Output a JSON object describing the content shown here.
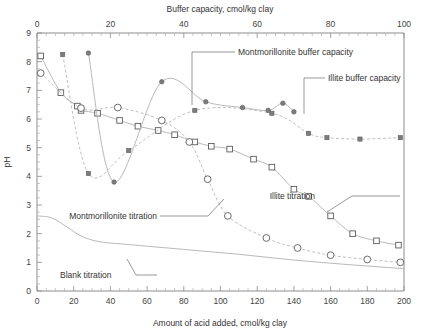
{
  "chart_data": {
    "type": "line",
    "title": "",
    "xlabel": "Amount of acid added, cmol/kg clay",
    "xlabel_top": "Buffer capacity, cmol/kg clay",
    "ylabel": "pH",
    "xlim": [
      0,
      200
    ],
    "xlim_top": [
      0,
      100
    ],
    "ylim": [
      0,
      9
    ],
    "grid": false,
    "legend_position": "none",
    "x_ticks": [
      0,
      20,
      40,
      60,
      80,
      100,
      120,
      140,
      160,
      180,
      200
    ],
    "x_ticks_top": [
      0,
      20,
      40,
      60,
      80,
      100
    ],
    "y_ticks": [
      0,
      1,
      2,
      3,
      4,
      5,
      6,
      7,
      8,
      9
    ],
    "x_minor_step": 5,
    "x_minor_step_top": 2.5,
    "y_minor_step": 0.25,
    "series": [
      {
        "name": "Illite titration",
        "marker": "open-square",
        "axis": "bottom",
        "points": [
          [
            2,
            8.2
          ],
          [
            13,
            6.92
          ],
          [
            22,
            6.45
          ],
          [
            24,
            6.3
          ],
          [
            33,
            6.2
          ],
          [
            45,
            5.95
          ],
          [
            55,
            5.75
          ],
          [
            66,
            5.6
          ],
          [
            75,
            5.45
          ],
          [
            86,
            5.2
          ],
          [
            95,
            5.05
          ],
          [
            105,
            4.95
          ],
          [
            118,
            4.6
          ],
          [
            128,
            4.32
          ],
          [
            140,
            3.55
          ],
          [
            148,
            3.3
          ],
          [
            160,
            2.62
          ],
          [
            172,
            2.0
          ],
          [
            185,
            1.75
          ],
          [
            197,
            1.6
          ]
        ]
      },
      {
        "name": "Montmorillonite titration",
        "marker": "open-circle",
        "axis": "bottom",
        "points": [
          [
            2,
            7.6
          ],
          [
            24,
            6.38
          ],
          [
            44,
            6.4
          ],
          [
            68,
            5.95
          ],
          [
            83,
            5.2
          ],
          [
            93,
            3.9
          ],
          [
            104,
            2.62
          ],
          [
            125,
            1.85
          ],
          [
            142,
            1.5
          ],
          [
            160,
            1.25
          ],
          [
            180,
            1.1
          ],
          [
            198,
            1.0
          ]
        ]
      },
      {
        "name": "Illite buffer capacity",
        "marker": "filled-square",
        "axis": "top",
        "points": [
          [
            7,
            8.25
          ],
          [
            14,
            4.1
          ],
          [
            25,
            4.9
          ],
          [
            43,
            6.3
          ],
          [
            64,
            6.2
          ],
          [
            74,
            5.5
          ],
          [
            79,
            5.35
          ],
          [
            88,
            5.3
          ],
          [
            99,
            5.35
          ]
        ]
      },
      {
        "name": "Montmorillonite buffer capacity",
        "marker": "filled-circle",
        "axis": "top",
        "points": [
          [
            14,
            8.3
          ],
          [
            21,
            3.8
          ],
          [
            34,
            7.3
          ],
          [
            46,
            6.6
          ],
          [
            56,
            6.4
          ],
          [
            63,
            6.3
          ],
          [
            67,
            6.55
          ],
          [
            70,
            6.25
          ]
        ]
      },
      {
        "name": "Blank titration",
        "marker": "none",
        "axis": "bottom",
        "points": [
          [
            0,
            2.62
          ],
          [
            8,
            2.55
          ],
          [
            16,
            2.25
          ],
          [
            24,
            1.92
          ],
          [
            34,
            1.72
          ],
          [
            50,
            1.62
          ],
          [
            80,
            1.45
          ],
          [
            110,
            1.28
          ],
          [
            140,
            1.08
          ],
          [
            170,
            0.92
          ],
          [
            200,
            0.78
          ]
        ]
      }
    ],
    "annotations": [
      {
        "text": "Montmorillonite buffer capacity",
        "target_note": "points to montmorillonite buffer capacity curve"
      },
      {
        "text": "Illite buffer capacity",
        "target_note": "points to illite buffer capacity curve"
      },
      {
        "text": "Illite titration",
        "target_note": "points to illite titration curve"
      },
      {
        "text": "Montmorillonite titration",
        "target_note": "points to montmorillonite titration curve"
      },
      {
        "text": "Blank titration",
        "target_note": "points to blank titration curve"
      }
    ]
  },
  "axes": {
    "top_title": "Buffer capacity, cmol/kg clay",
    "bottom_title": "Amount of acid added, cmol/kg clay",
    "y_title": "pH",
    "top_ticks": [
      "0",
      "20",
      "40",
      "60",
      "80",
      "100"
    ],
    "bottom_ticks": [
      "0",
      "20",
      "40",
      "60",
      "80",
      "100",
      "120",
      "140",
      "160",
      "180",
      "200"
    ],
    "y_ticks": [
      "9",
      "8",
      "7",
      "6",
      "5",
      "4",
      "3",
      "2",
      "1",
      "0"
    ]
  },
  "annotations": {
    "mont_buffer": "Montmorillonite buffer capacity",
    "illite_buffer": "Illite buffer capacity",
    "illite_titration": "Illite titration",
    "mont_titration": "Montmorillonite titration",
    "blank_titration": "Blank titration"
  },
  "colors": {
    "background": "#ffffff",
    "axis": "#8d8d8d",
    "curve": "#b9b9b9",
    "marker_open_fill": "#ffffff",
    "marker_stroke": "#5b5b5b",
    "marker_filled": "#7c7c7c",
    "text": "#333333"
  }
}
